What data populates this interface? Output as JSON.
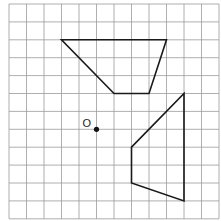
{
  "diagram": {
    "type": "grid-transformation",
    "grid": {
      "columns": 12,
      "rows": 12,
      "origin_px": [
        9,
        4
      ],
      "cell_w": 17.5,
      "cell_h": 17.9,
      "line_color": "#9a9a9a"
    },
    "shapes": [
      {
        "name": "upper-trapezoid",
        "vertices": [
          [
            3,
            2
          ],
          [
            9,
            2
          ],
          [
            8,
            5
          ],
          [
            6,
            5
          ]
        ]
      },
      {
        "name": "lower-quadrilateral",
        "vertices": [
          [
            10,
            5
          ],
          [
            10,
            11
          ],
          [
            7,
            10
          ],
          [
            7,
            8
          ]
        ]
      }
    ],
    "point": {
      "label": "O",
      "position": [
        5,
        7
      ]
    },
    "stroke_color": "#1a1a1a"
  }
}
